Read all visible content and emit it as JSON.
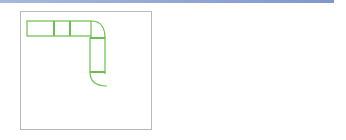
{
  "diagram": {
    "colors": {
      "pipe": "#6cbf4f",
      "error_mark": "#e03a1e",
      "arrow": "#7f97cc",
      "border": "#b9b9b9"
    },
    "left_panel": {
      "markers": [
        {
          "number": "1",
          "symbol": "×"
        },
        {
          "number": "2",
          "symbol": "×"
        }
      ]
    },
    "right_panel": {}
  }
}
